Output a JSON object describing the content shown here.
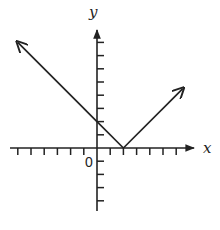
{
  "chart_data": {
    "type": "line",
    "title": "",
    "function": "y = |x - 2|",
    "xlabel": "x",
    "ylabel": "y",
    "origin_label": "0",
    "xlim": [
      -7,
      7
    ],
    "ylim": [
      -5,
      9
    ],
    "x_ticks_negative": 6,
    "x_ticks_positive": 6,
    "y_ticks_positive": 8,
    "y_ticks_negative": 4,
    "tick_labels_shown": false,
    "grid": false,
    "series": [
      {
        "name": "left branch",
        "points": [
          [
            2,
            0
          ],
          [
            0,
            2
          ],
          [
            -6,
            8
          ]
        ],
        "arrow_at_end": true
      },
      {
        "name": "right branch",
        "points": [
          [
            2,
            0
          ],
          [
            6.5,
            4.5
          ]
        ],
        "arrow_at_end": true
      }
    ],
    "vertex": [
      2,
      0
    ],
    "y_intercept": 2,
    "colors": {
      "line": "#222222",
      "axis": "#222222"
    }
  }
}
